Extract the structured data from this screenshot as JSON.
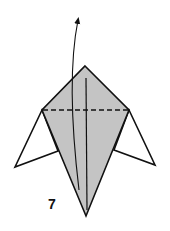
{
  "diagram": {
    "step_number": "7",
    "colors": {
      "paper_fill": "#c4c4c4",
      "stroke": "#111111",
      "background": "#ffffff"
    },
    "shapes": {
      "kite": {
        "top": [
          85,
          66
        ],
        "left": [
          42,
          110
        ],
        "right": [
          129,
          110
        ],
        "bottom": [
          86,
          216
        ]
      },
      "left_wing": {
        "attach_top": [
          42,
          110
        ],
        "tip": [
          15,
          167
        ],
        "attach_bottom": [
          58,
          151
        ]
      },
      "right_wing": {
        "attach_top": [
          129,
          110
        ],
        "tip": [
          155,
          165
        ],
        "attach_bottom": [
          114,
          150
        ]
      },
      "valley_fold_line": {
        "from": [
          42,
          110
        ],
        "to": [
          129,
          110
        ],
        "style": "dashed"
      },
      "center_crease": {
        "from": [
          86,
          78
        ],
        "to": [
          87,
          210
        ]
      },
      "fold_arrow": {
        "start": [
          79,
          190
        ],
        "end": [
          78,
          19
        ],
        "direction": "up"
      }
    }
  }
}
